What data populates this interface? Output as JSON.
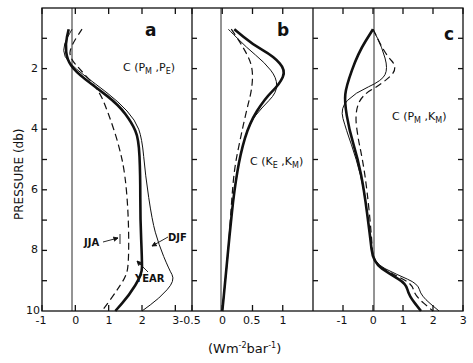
{
  "chart_data": {
    "type": "line",
    "shared": {
      "ylabel": "PRESSURE (db)",
      "xlabel": "(Wm-2bar-1)",
      "ylim": [
        0,
        10
      ],
      "yticks": [
        "2",
        "4",
        "6",
        "8",
        "10"
      ],
      "y_inverted": true,
      "grid": false
    },
    "panels": [
      {
        "id": "a",
        "label": "a",
        "title": "C (PM, PE)",
        "xlim": [
          -1,
          3.5
        ],
        "xticks": [
          "-1",
          "0",
          "1",
          "2",
          "3"
        ],
        "series": [
          {
            "name": "YEAR",
            "style": "thick-solid",
            "points": [
              [
                -0.2,
                0.7
              ],
              [
                -0.3,
                1.2
              ],
              [
                -0.25,
                1.7
              ],
              [
                0,
                2.1
              ],
              [
                0.6,
                2.6
              ],
              [
                1.3,
                3.2
              ],
              [
                1.7,
                3.8
              ],
              [
                1.9,
                4.3
              ],
              [
                1.95,
                5.5
              ],
              [
                1.95,
                7
              ],
              [
                2.0,
                8.3
              ],
              [
                2.0,
                8.8
              ],
              [
                1.6,
                9.5
              ],
              [
                1.2,
                10
              ]
            ]
          },
          {
            "name": "DJF",
            "style": "thin-solid",
            "points": [
              [
                -0.1,
                0.7
              ],
              [
                -0.35,
                1.2
              ],
              [
                -0.35,
                1.6
              ],
              [
                0,
                2.0
              ],
              [
                0.6,
                2.5
              ],
              [
                1.3,
                3.1
              ],
              [
                1.8,
                3.7
              ],
              [
                2.0,
                4.3
              ],
              [
                2.1,
                5.5
              ],
              [
                2.3,
                7
              ],
              [
                2.5,
                7.8
              ],
              [
                2.8,
                8.6
              ],
              [
                3.0,
                9.0
              ],
              [
                2.5,
                9.6
              ],
              [
                2.0,
                10
              ]
            ]
          },
          {
            "name": "JJA",
            "style": "dashed",
            "points": [
              [
                0.2,
                0.7
              ],
              [
                -0.1,
                1.2
              ],
              [
                -0.2,
                1.6
              ],
              [
                0.2,
                2.1
              ],
              [
                0.7,
                2.7
              ],
              [
                1.0,
                3.5
              ],
              [
                1.3,
                4.5
              ],
              [
                1.5,
                5.5
              ],
              [
                1.6,
                7
              ],
              [
                1.6,
                8.5
              ],
              [
                1.5,
                8.9
              ],
              [
                1.2,
                9.4
              ],
              [
                0.8,
                10
              ]
            ]
          }
        ],
        "annotations": [
          "JJA",
          "YEAR",
          "DJF"
        ]
      },
      {
        "id": "b",
        "label": "b",
        "title": "C (KE, KM)",
        "xlim": [
          -0.5,
          1.5
        ],
        "xticks": [
          "-0.5",
          "0",
          "0.5",
          "1"
        ],
        "series": [
          {
            "name": "YEAR",
            "style": "thick-solid",
            "points": [
              [
                0.2,
                0.7
              ],
              [
                0.5,
                1.2
              ],
              [
                0.85,
                1.6
              ],
              [
                1.05,
                2.05
              ],
              [
                0.95,
                2.5
              ],
              [
                0.7,
                3.0
              ],
              [
                0.45,
                3.8
              ],
              [
                0.3,
                4.8
              ],
              [
                0.2,
                6
              ],
              [
                0.12,
                7.5
              ],
              [
                0.05,
                9
              ],
              [
                0,
                10
              ]
            ]
          },
          {
            "name": "DJF",
            "style": "thin-solid",
            "points": [
              [
                0.1,
                0.7
              ],
              [
                0.4,
                1.3
              ],
              [
                0.7,
                1.8
              ],
              [
                0.9,
                2.3
              ],
              [
                0.9,
                2.8
              ],
              [
                0.65,
                3.3
              ],
              [
                0.45,
                3.8
              ],
              [
                0.3,
                4.8
              ],
              [
                0.2,
                6
              ],
              [
                0.12,
                7.5
              ],
              [
                0.05,
                9
              ],
              [
                0,
                10
              ]
            ]
          },
          {
            "name": "JJA",
            "style": "dashed",
            "points": [
              [
                0.15,
                0.7
              ],
              [
                0.35,
                1.3
              ],
              [
                0.5,
                1.9
              ],
              [
                0.5,
                2.6
              ],
              [
                0.4,
                3.4
              ],
              [
                0.3,
                4.3
              ],
              [
                0.2,
                5.3
              ],
              [
                0.15,
                6.5
              ],
              [
                0.1,
                8
              ],
              [
                0.05,
                9
              ],
              [
                0,
                10
              ]
            ]
          }
        ]
      },
      {
        "id": "c",
        "label": "c",
        "title": "C (PM, KM)",
        "xlim": [
          -2,
          3
        ],
        "xticks": [
          "-1",
          "0",
          "1",
          "2",
          "3"
        ],
        "series": [
          {
            "name": "YEAR",
            "style": "thick-solid",
            "points": [
              [
                0,
                0.7
              ],
              [
                -0.5,
                1.5
              ],
              [
                -0.9,
                2.6
              ],
              [
                -0.95,
                3.1
              ],
              [
                -0.8,
                4.0
              ],
              [
                -0.5,
                5
              ],
              [
                -0.3,
                6
              ],
              [
                -0.1,
                7.5
              ],
              [
                0,
                8.4
              ],
              [
                0.6,
                8.8
              ],
              [
                1.1,
                9.1
              ],
              [
                1.2,
                9.5
              ],
              [
                1.6,
                10
              ]
            ]
          },
          {
            "name": "DJF",
            "style": "thin-solid",
            "points": [
              [
                0,
                0.7
              ],
              [
                0.3,
                1.3
              ],
              [
                0.5,
                2.0
              ],
              [
                0.3,
                2.4
              ],
              [
                -0.6,
                2.8
              ],
              [
                -1.1,
                3.3
              ],
              [
                -0.9,
                4.0
              ],
              [
                -0.55,
                5
              ],
              [
                -0.3,
                6
              ],
              [
                -0.1,
                7.5
              ],
              [
                0,
                8.4
              ],
              [
                0.8,
                8.8
              ],
              [
                1.5,
                9.1
              ],
              [
                1.6,
                9.5
              ],
              [
                2.2,
                10
              ]
            ]
          },
          {
            "name": "JJA",
            "style": "dashed",
            "points": [
              [
                0,
                0.7
              ],
              [
                0.4,
                1.5
              ],
              [
                0.85,
                2.0
              ],
              [
                0.3,
                2.5
              ],
              [
                -0.4,
                2.9
              ],
              [
                -0.6,
                3.5
              ],
              [
                -0.5,
                4.3
              ],
              [
                -0.35,
                5
              ],
              [
                -0.2,
                6
              ],
              [
                -0.05,
                7.5
              ],
              [
                0,
                8.4
              ],
              [
                0.7,
                8.8
              ],
              [
                1.3,
                9.1
              ],
              [
                1.4,
                9.5
              ],
              [
                2.0,
                10
              ]
            ]
          }
        ]
      }
    ]
  },
  "labels": {
    "ylabel": "PRESSURE (db)",
    "xunit_main": "(Wm",
    "xunit_sup1": "-2",
    "xunit_mid": "bar",
    "xunit_sup2": "-1",
    "xunit_end": ")",
    "panel_a": "a",
    "panel_b": "b",
    "panel_c": "c",
    "title_a_c": "C (P",
    "title_a_sub1": "M",
    "title_a_sep": " ,P",
    "title_a_sub2": "E",
    "title_a_end": ")",
    "title_b_c": "C (K",
    "title_b_sub1": "E",
    "title_b_sep": " ,K",
    "title_b_sub2": "M",
    "title_b_end": ")",
    "title_c_c": "C (P",
    "title_c_sub1": "M",
    "title_c_sep": " ,K",
    "title_c_sub2": "M",
    "title_c_end": ")",
    "ann_jja": "JJA",
    "ann_year": "YEAR",
    "ann_djf": "DJF",
    "yticks": [
      "2",
      "4",
      "6",
      "8",
      "10"
    ],
    "xticks_a": [
      "-1",
      "0",
      "1",
      "2",
      "3"
    ],
    "xticks_b": [
      "-0.5",
      "0",
      "0.5",
      "1"
    ],
    "xticks_c": [
      "-1",
      "0",
      "1",
      "2",
      "3"
    ]
  }
}
